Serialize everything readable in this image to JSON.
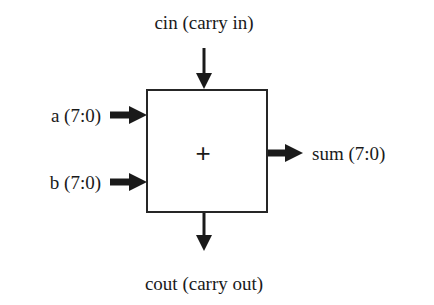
{
  "diagram": {
    "block": {
      "operator_symbol": "+",
      "border_color": "#262626",
      "fill_color": "#ffffff"
    },
    "ports": {
      "cin": {
        "label": "cin (carry in)",
        "direction": "input",
        "side": "top"
      },
      "a": {
        "label": "a (7:0)",
        "direction": "input",
        "side": "left"
      },
      "b": {
        "label": "b (7:0)",
        "direction": "input",
        "side": "left"
      },
      "sum": {
        "label": "sum (7:0)",
        "direction": "output",
        "side": "right"
      },
      "cout": {
        "label": "cout (carry out)",
        "direction": "output",
        "side": "bottom"
      }
    },
    "colors": {
      "background": "#ffffff",
      "ink": "#1a1a1a"
    }
  }
}
